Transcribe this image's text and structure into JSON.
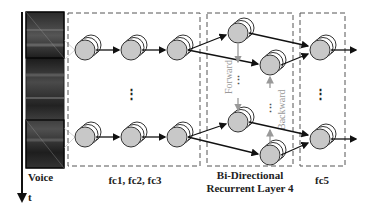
{
  "labels": {
    "voice": "Voice",
    "time_axis": "t",
    "fc_group": "fc1, fc2, fc3",
    "birnn_line1": "Bi-Directional",
    "birnn_line2": "Recurrent Layer 4",
    "fc5": "fc5",
    "forward": "Forward",
    "backward": "Backward",
    "ellipsis": "⋮"
  },
  "colors": {
    "node_fill": "#c8c8c8",
    "node_stroke": "#333333",
    "arrow": "#111111",
    "recurrent_arrow": "#999999",
    "dashed_box": "#555555",
    "spectrogram_dark": "#1a1a1a"
  }
}
